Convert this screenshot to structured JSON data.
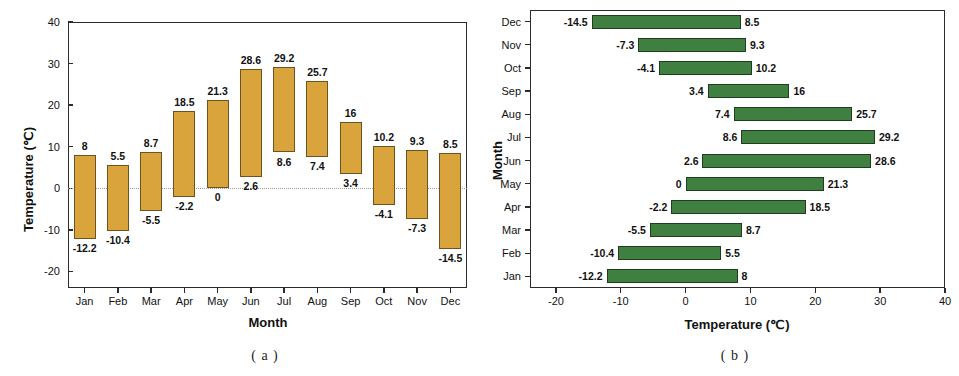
{
  "figure": {
    "panel_a_caption": "( a )",
    "panel_b_caption": "( b )"
  },
  "chart_data": [
    {
      "id": "panel-a",
      "type": "bar",
      "orientation": "vertical",
      "subtype": "floating-range-bar",
      "title": "",
      "xlabel": "Month",
      "ylabel": "Temperature (℃)",
      "ylim": [
        -24,
        40
      ],
      "yticks": [
        -20,
        -10,
        0,
        10,
        20,
        30,
        40
      ],
      "grid": false,
      "legend": "none",
      "bar_color": "#D9A43C",
      "categories": [
        "Jan",
        "Feb",
        "Mar",
        "Apr",
        "May",
        "Jun",
        "Jul",
        "Aug",
        "Sep",
        "Oct",
        "Nov",
        "Dec"
      ],
      "series": [
        {
          "name": "Minimum temperature",
          "values": [
            -12.2,
            -10.4,
            -5.5,
            -2.2,
            0,
            2.6,
            8.6,
            7.4,
            3.4,
            -4.1,
            -7.3,
            -14.5
          ]
        },
        {
          "name": "Maximum temperature",
          "values": [
            8,
            5.5,
            8.7,
            18.5,
            21.3,
            28.6,
            29.2,
            25.7,
            16,
            10.2,
            9.3,
            8.5
          ]
        }
      ],
      "min_labels": [
        "-12.2",
        "-10.4",
        "-5.5",
        "-2.2",
        "0",
        "2.6",
        "8.6",
        "7.4",
        "3.4",
        "-4.1",
        "-7.3",
        "-14.5"
      ],
      "max_labels": [
        "8",
        "5.5",
        "8.7",
        "18.5",
        "21.3",
        "28.6",
        "29.2",
        "25.7",
        "16",
        "10.2",
        "9.3",
        "8.5"
      ],
      "ytick_labels": [
        "-20",
        "-10",
        "0",
        "10",
        "20",
        "30",
        "40"
      ]
    },
    {
      "id": "panel-b",
      "type": "bar",
      "orientation": "horizontal",
      "subtype": "floating-range-bar",
      "title": "",
      "xlabel": "Temperature (℃)",
      "ylabel": "Month",
      "xlim": [
        -24,
        40
      ],
      "xticks": [
        -20,
        -10,
        0,
        10,
        20,
        30,
        40
      ],
      "grid": false,
      "legend": "none",
      "bar_color": "#3F7F3F",
      "categories": [
        "Jan",
        "Feb",
        "Mar",
        "Apr",
        "May",
        "Jun",
        "Jul",
        "Aug",
        "Sep",
        "Oct",
        "Nov",
        "Dec"
      ],
      "categories_top_to_bottom": [
        "Dec",
        "Nov",
        "Oct",
        "Sep",
        "Aug",
        "Jul",
        "Jun",
        "May",
        "Apr",
        "Mar",
        "Feb",
        "Jan"
      ],
      "series": [
        {
          "name": "Minimum temperature",
          "values": [
            -12.2,
            -10.4,
            -5.5,
            -2.2,
            0,
            2.6,
            8.6,
            7.4,
            3.4,
            -4.1,
            -7.3,
            -14.5
          ]
        },
        {
          "name": "Maximum temperature",
          "values": [
            8,
            5.5,
            8.7,
            18.5,
            21.3,
            28.6,
            29.2,
            25.7,
            16,
            10.2,
            9.3,
            8.5
          ]
        }
      ],
      "min_labels": [
        "-12.2",
        "-10.4",
        "-5.5",
        "-2.2",
        "0",
        "2.6",
        "8.6",
        "7.4",
        "3.4",
        "-4.1",
        "-7.3",
        "-14.5"
      ],
      "max_labels": [
        "8",
        "5.5",
        "8.7",
        "18.5",
        "21.3",
        "28.6",
        "29.2",
        "25.7",
        "16",
        "10.2",
        "9.3",
        "8.5"
      ],
      "xtick_labels": [
        "-20",
        "-10",
        "0",
        "10",
        "20",
        "30",
        "40"
      ]
    }
  ]
}
